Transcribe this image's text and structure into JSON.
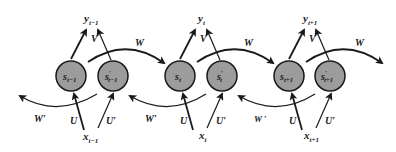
{
  "diagram": {
    "colors": {
      "node_fill": "#9c9c9c",
      "node_stroke": "#1a1a1a",
      "arrow": "#1a1a1a",
      "background": "#ffffff"
    },
    "timesteps": [
      {
        "forward_state": {
          "base": "s",
          "sub": "t−1",
          "prime": ""
        },
        "backward_state": {
          "base": "s",
          "sub": "t−1",
          "prime": "′"
        },
        "output": {
          "base": "y",
          "sub": "t−1"
        },
        "input": {
          "base": "x",
          "sub": "t−1"
        },
        "V_label": "V",
        "U_label": "U",
        "U_prime_label": "U′",
        "W_label": "W",
        "W_prime_label": "W′"
      },
      {
        "forward_state": {
          "base": "s",
          "sub": "t",
          "prime": ""
        },
        "backward_state": {
          "base": "s",
          "sub": "t",
          "prime": "′"
        },
        "output": {
          "base": "y",
          "sub": "t"
        },
        "input": {
          "base": "x",
          "sub": "t"
        },
        "V_label": "V",
        "U_label": "U",
        "U_prime_label": "U′",
        "W_label": "W",
        "W_prime_label": "W′"
      },
      {
        "forward_state": {
          "base": "s",
          "sub": "t+1",
          "prime": ""
        },
        "backward_state": {
          "base": "s",
          "sub": "t+1",
          "prime": "′"
        },
        "output": {
          "base": "y",
          "sub": "t+1"
        },
        "input": {
          "base": "x",
          "sub": "t+1"
        },
        "V_label": "V",
        "U_label": "U",
        "U_prime_label": "U′",
        "W_label": "W",
        "W_prime_label": "W ′"
      }
    ]
  }
}
